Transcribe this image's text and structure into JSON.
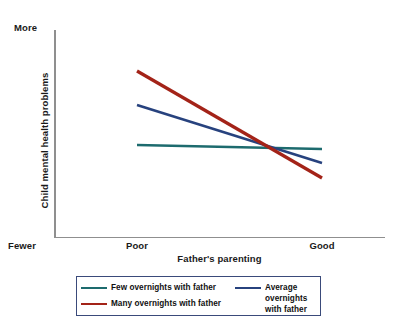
{
  "chart_data": {
    "type": "line",
    "title": "",
    "xlabel": "Father's parenting",
    "ylabel": "Child mental health problems",
    "x_tick_labels": [
      "Poor",
      "Good"
    ],
    "y_axis_low_label": "Fewer",
    "y_axis_high_label": "More",
    "x": [
      "Poor",
      "Good"
    ],
    "xlim": [
      "Poor",
      "Good"
    ],
    "ylim": [
      "Fewer",
      "More"
    ],
    "grid": false,
    "legend_position": "below-plot",
    "series": [
      {
        "name": "Few overnights with father",
        "color": "#1d6b6e",
        "values": [
          0.435,
          0.415
        ],
        "pixel_points": [
          [
            137,
            145
          ],
          [
            322,
            149
          ]
        ]
      },
      {
        "name": "Average overnights with father",
        "color": "#27427e",
        "values": [
          0.635,
          0.345
        ],
        "pixel_points": [
          [
            137,
            105
          ],
          [
            322,
            163
          ]
        ]
      },
      {
        "name": "Many overnights with father",
        "color": "#a32318",
        "values": [
          0.8,
          0.27
        ],
        "pixel_points": [
          [
            137,
            71
          ],
          [
            322,
            178
          ]
        ]
      }
    ],
    "annotations": [
      "Lines converge near the 'Good' end of father's parenting"
    ]
  },
  "axes": {
    "y_high_label": "More",
    "y_low_label": "Fewer",
    "y_title": "Child mental health problems",
    "x_title": "Father's parenting",
    "x_tick_poor": "Poor",
    "x_tick_good": "Good",
    "axis_color": "#8f8f8f"
  },
  "legend": {
    "border_color": "#3a4a7a",
    "items": [
      {
        "label": "Few overnights with father",
        "color": "#1d6b6e"
      },
      {
        "label": "Many overnights with father",
        "color": "#a32318"
      },
      {
        "label": "Average overnights with father",
        "color": "#27427e"
      }
    ]
  }
}
